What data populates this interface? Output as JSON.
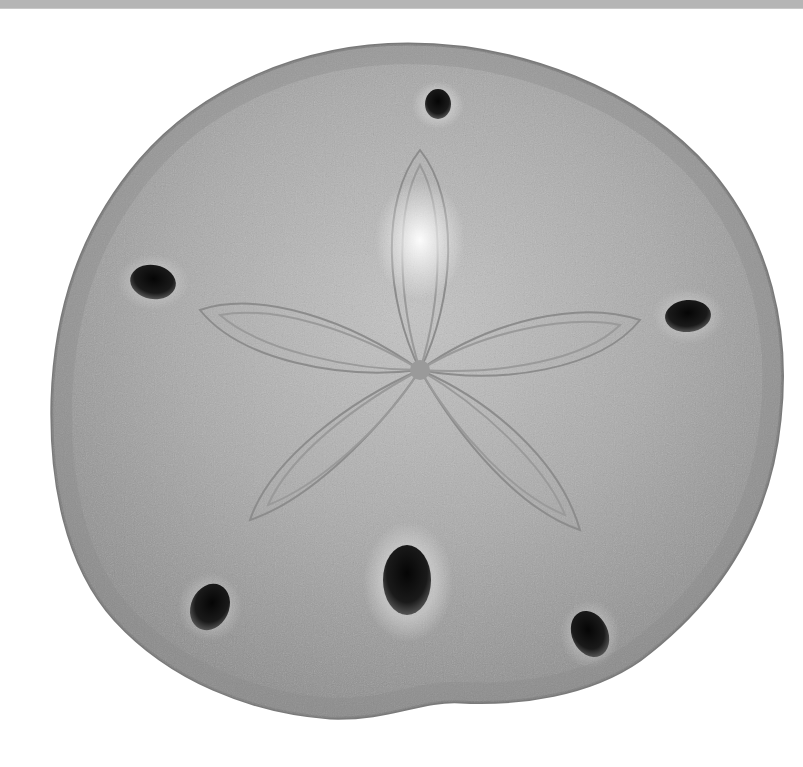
{
  "image": {
    "subject": "sand dollar",
    "description": "Top view of a bleached sand dollar test on a white background with a five-petal star pattern and six oval openings (lunules)",
    "background_color": "#ffffff",
    "top_band_color": "#b5b5b5",
    "shell_color": "#a9a9a9",
    "shell_highlight_color": "#d4d4d4",
    "hole_color": "#0d0d0d",
    "petal_count": 5,
    "hole_count": 6
  }
}
